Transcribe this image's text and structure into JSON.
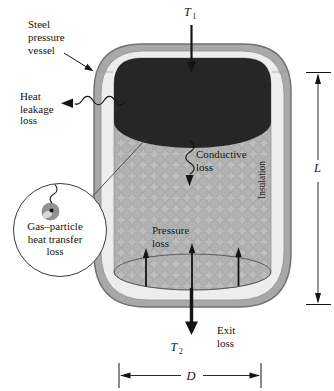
{
  "figure": {
    "labels": {
      "steel_vessel": {
        "line1": "Steel",
        "line2": "pressure",
        "line3": "vessel"
      },
      "heat_leakage": {
        "line1": "Heat",
        "line2": "leakage",
        "line3": "loss"
      },
      "gas_particle": {
        "line1": "Gas–particle",
        "line2": "heat transfer",
        "line3": "loss"
      },
      "conductive_loss": {
        "line1": "Conductive",
        "line2": "loss"
      },
      "pressure_loss": {
        "line1": "Pressure",
        "line2": "loss"
      },
      "exit_loss": {
        "line1": "Exit",
        "line2": "loss"
      },
      "insulation": "Insulation",
      "inlet_temp": {
        "symbol": "T",
        "subscript": "1"
      },
      "outlet_temp": {
        "symbol": "T",
        "subscript": "2"
      },
      "length_dimension": "L",
      "diameter_dimension": "D"
    },
    "colors": {
      "steel_shell": "#a8a8a8",
      "shell_outline": "#707070",
      "insulation_layer": "#ededed",
      "particle_bed": "#bdbdbd",
      "hot_gas_region": "#262626",
      "line_color": "#141414",
      "background": "#ffffff"
    }
  }
}
